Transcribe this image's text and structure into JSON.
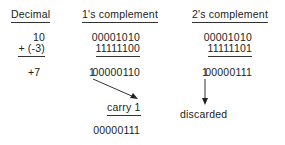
{
  "headers": {
    "decimal": "Decimal",
    "ones": "1's complement",
    "twos": "2's complement"
  },
  "decimal": {
    "a": "10",
    "b": "+ (-3)",
    "result": "+7"
  },
  "ones": {
    "a": "00001010",
    "b": "11111100",
    "sum_carry": "1",
    "sum": "00000110",
    "carry_label": "carry 1",
    "final": "00000111"
  },
  "twos": {
    "a": "00001010",
    "b": "11111101",
    "sum_carry": "1",
    "sum": "00000111",
    "discard_label": "discarded"
  },
  "colors": {
    "text": "#222222",
    "lines": "#333333",
    "background": "#ffffff"
  }
}
